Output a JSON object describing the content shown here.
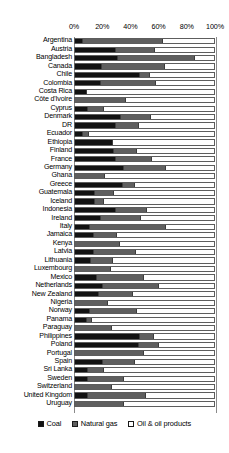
{
  "chart_data": {
    "type": "bar",
    "orientation": "horizontal",
    "stacked": true,
    "normalized_percent": true,
    "title": "",
    "subtitle": "",
    "xlabel": "",
    "ylabel": "",
    "xlim": [
      0,
      100
    ],
    "grid": false,
    "legend_position": "bottom",
    "axis_tick_labels": [
      "0%",
      "20%",
      "40%",
      "60%",
      "80%",
      "100%"
    ],
    "axis_tick_values": [
      0,
      20,
      40,
      60,
      80,
      100
    ],
    "legend": [
      {
        "name": "Coal",
        "color": "#121212"
      },
      {
        "name": "Natural gas",
        "color": "#5f5f5f"
      },
      {
        "name": "Oil & oil products",
        "color": "#ffffff"
      }
    ],
    "series": [
      {
        "name": "Coal",
        "color": "#121212"
      },
      {
        "name": "Natural gas",
        "color": "#5f5f5f"
      },
      {
        "name": "Oil & oil products",
        "color": "#ffffff"
      }
    ],
    "categories": [
      "Argentina",
      "Austria",
      "Bangladesh",
      "Canada",
      "Chile",
      "Colombia",
      "Costa Rica",
      "Côte d'Ivoire",
      "Cyprus",
      "Denmark",
      "DR",
      "Ecuador",
      "Ethiopia",
      "Finland",
      "France",
      "Germany",
      "Ghana",
      "Greece",
      "Guatemala",
      "Iceland",
      "Indonesia",
      "Ireland",
      "Italy",
      "Jamaica",
      "Kenya",
      "Latvia",
      "Lithuania",
      "Luxembourg",
      "Mexico",
      "Netherlands",
      "New Zealand",
      "Nigeria",
      "Norway",
      "Panama",
      "Paraguay",
      "Philippines",
      "Poland",
      "Portugal",
      "Spain",
      "Sri Lanka",
      "Sweden",
      "Switzerland",
      "United Kingdom",
      "Uruguay"
    ],
    "rows": [
      {
        "category": "Argentina",
        "coal": 5,
        "gas": 58,
        "oil": 37
      },
      {
        "category": "Austria",
        "coal": 29,
        "gas": 28,
        "oil": 43
      },
      {
        "category": "Bangladesh",
        "coal": 31,
        "gas": 55,
        "oil": 14
      },
      {
        "category": "Canada",
        "coal": 19,
        "gas": 45,
        "oil": 36
      },
      {
        "category": "Chile",
        "coal": 47,
        "gas": 6,
        "oil": 47
      },
      {
        "category": "Colombia",
        "coal": 18,
        "gas": 40,
        "oil": 42
      },
      {
        "category": "Costa Rica",
        "coal": 8,
        "gas": 0,
        "oil": 92
      },
      {
        "category": "Côte d'Ivoire",
        "coal": 0,
        "gas": 36,
        "oil": 64
      },
      {
        "category": "Cyprus",
        "coal": 9,
        "gas": 11,
        "oil": 80
      },
      {
        "category": "Denmark",
        "coal": 33,
        "gas": 21,
        "oil": 46
      },
      {
        "category": "DR",
        "coal": 29,
        "gas": 16,
        "oil": 55
      },
      {
        "category": "Ecuador",
        "coal": 5,
        "gas": 4,
        "oil": 91
      },
      {
        "category": "Ethiopia",
        "coal": 27,
        "gas": 0,
        "oil": 73
      },
      {
        "category": "Finland",
        "coal": 28,
        "gas": 16,
        "oil": 56
      },
      {
        "category": "France",
        "coal": 29,
        "gas": 26,
        "oil": 45
      },
      {
        "category": "Germany",
        "coal": 35,
        "gas": 30,
        "oil": 35
      },
      {
        "category": "Ghana",
        "coal": 0,
        "gas": 21,
        "oil": 79
      },
      {
        "category": "Greece",
        "coal": 34,
        "gas": 8,
        "oil": 58
      },
      {
        "category": "Guatemala",
        "coal": 14,
        "gas": 13,
        "oil": 73
      },
      {
        "category": "Iceland",
        "coal": 14,
        "gas": 6,
        "oil": 80
      },
      {
        "category": "Indonesia",
        "coal": 29,
        "gas": 22,
        "oil": 49
      },
      {
        "category": "Ireland",
        "coal": 18,
        "gas": 29,
        "oil": 53
      },
      {
        "category": "Italy",
        "coal": 10,
        "gas": 55,
        "oil": 35
      },
      {
        "category": "Jamaica",
        "coal": 13,
        "gas": 16,
        "oil": 71
      },
      {
        "category": "Kenya",
        "coal": 0,
        "gas": 32,
        "oil": 68
      },
      {
        "category": "Latvia",
        "coal": 13,
        "gas": 30,
        "oil": 57
      },
      {
        "category": "Lithuania",
        "coal": 11,
        "gas": 15,
        "oil": 74
      },
      {
        "category": "Luxembourg",
        "coal": 0,
        "gas": 25,
        "oil": 75
      },
      {
        "category": "Mexico",
        "coal": 15,
        "gas": 34,
        "oil": 51
      },
      {
        "category": "Netherlands",
        "coal": 20,
        "gas": 40,
        "oil": 40
      },
      {
        "category": "New Zealand",
        "coal": 17,
        "gas": 24,
        "oil": 59
      },
      {
        "category": "Nigeria",
        "coal": 0,
        "gas": 23,
        "oil": 77
      },
      {
        "category": "Norway",
        "coal": 10,
        "gas": 34,
        "oil": 56
      },
      {
        "category": "Panama",
        "coal": 8,
        "gas": 3,
        "oil": 89
      },
      {
        "category": "Paraguay",
        "coal": 0,
        "gas": 26,
        "oil": 74
      },
      {
        "category": "Philippines",
        "coal": 47,
        "gas": 9,
        "oil": 44
      },
      {
        "category": "Poland",
        "coal": 46,
        "gas": 14,
        "oil": 40
      },
      {
        "category": "Portugal",
        "coal": 0,
        "gas": 49,
        "oil": 51
      },
      {
        "category": "Spain",
        "coal": 20,
        "gas": 22,
        "oil": 58
      },
      {
        "category": "Sri Lanka",
        "coal": 9,
        "gas": 11,
        "oil": 80
      },
      {
        "category": "Sweden",
        "coal": 9,
        "gas": 25,
        "oil": 66
      },
      {
        "category": "Switzerland",
        "coal": 0,
        "gas": 26,
        "oil": 74
      },
      {
        "category": "United Kingdom",
        "coal": 9,
        "gas": 41,
        "oil": 50
      },
      {
        "category": "Uruguay",
        "coal": 0,
        "gas": 35,
        "oil": 65
      }
    ]
  }
}
